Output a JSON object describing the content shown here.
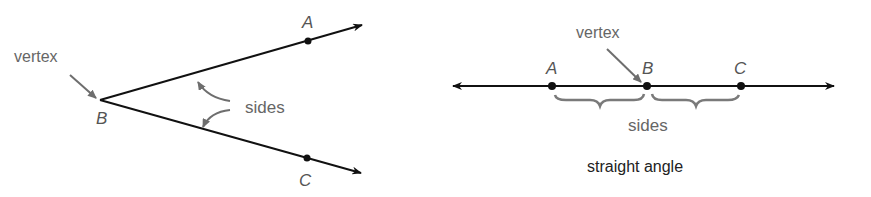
{
  "left_diagram": {
    "vertex_label": "vertex",
    "sides_label": "sides",
    "points": {
      "A": "A",
      "B": "B",
      "C": "C"
    }
  },
  "right_diagram": {
    "vertex_label": "vertex",
    "sides_label": "sides",
    "points": {
      "A": "A",
      "B": "B",
      "C": "C"
    },
    "caption": "straight angle"
  },
  "colors": {
    "line": "#111111",
    "annotation": "#6e6e6e",
    "label": "#555555"
  }
}
